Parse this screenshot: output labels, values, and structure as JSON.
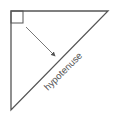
{
  "diagram": {
    "title": "",
    "shape": "right-triangle",
    "labels": {
      "hypotenuse": "hypotenuse"
    },
    "annotations": [
      {
        "type": "right-angle-marker",
        "at": "top-left vertex"
      },
      {
        "type": "arrow",
        "from": "right angle",
        "to": "hypotenuse"
      }
    ],
    "colors": {
      "stroke": "#555555",
      "text": "#555555",
      "background": "#ffffff"
    }
  }
}
